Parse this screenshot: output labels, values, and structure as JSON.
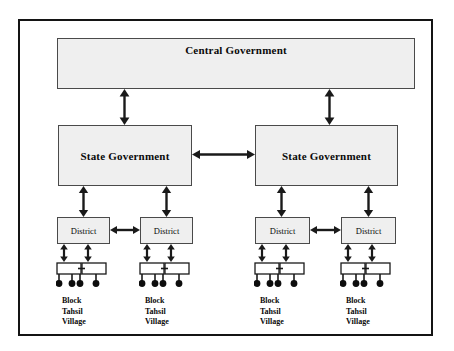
{
  "diagram": {
    "title_text": "",
    "caption": "",
    "colors": {
      "frame_border": "#141414",
      "box_border": "#4a4a4a",
      "box_fill": "#efefef",
      "arrow": "#1a1a1a",
      "text": "#0a0a0a"
    },
    "central": {
      "label": "Central Government"
    },
    "states": [
      {
        "label": "State Government"
      },
      {
        "label": "State Government"
      }
    ],
    "districts": [
      {
        "label": "District"
      },
      {
        "label": "District"
      },
      {
        "label": "District"
      },
      {
        "label": "District"
      }
    ],
    "leaf_groups": [
      {
        "lines": {
          "l1": "Block",
          "l2": "Tahsil",
          "l3": "Village"
        }
      },
      {
        "lines": {
          "l1": "Block",
          "l2": "Tahsil",
          "l3": "Village"
        }
      },
      {
        "lines": {
          "l1": "Block",
          "l2": "Tahsil",
          "l3": "Village"
        }
      },
      {
        "lines": {
          "l1": "Block",
          "l2": "Tahsil",
          "l3": "Village"
        }
      }
    ],
    "connectors": {
      "central_to_state_left": "double-arrow-vertical",
      "central_to_state_right": "double-arrow-vertical",
      "state_to_state": "double-arrow-horizontal",
      "state_to_district": "double-arrow-vertical",
      "district_to_district": "double-arrow-horizontal",
      "district_to_block": "double-arrow-vertical",
      "block_to_block": "double-arrow-horizontal-small"
    }
  }
}
